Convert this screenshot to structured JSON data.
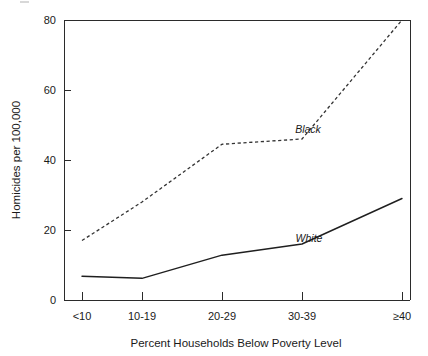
{
  "chart_data": {
    "type": "line",
    "title": "",
    "subtitle": "",
    "xlabel": "Percent Households Below Poverty Level",
    "ylabel": "Homicides per 100,000",
    "categories": [
      "<10",
      "10-19",
      "20-29",
      "30-39",
      "≥40"
    ],
    "series": [
      {
        "name": "Black",
        "style": "dashed",
        "color": "#333333",
        "values": [
          17,
          28,
          44.5,
          46,
          80
        ],
        "label_position": "above-right-of-midline"
      },
      {
        "name": "White",
        "style": "solid",
        "color": "#1f1f1f",
        "values": [
          6.8,
          6.2,
          12.8,
          16,
          29
        ],
        "label_position": "above-line-right"
      }
    ],
    "ylim": [
      0,
      80
    ],
    "yticks": [
      0,
      20,
      40,
      60,
      80
    ],
    "ytick_labels": [
      "0",
      "20",
      "40",
      "60",
      "80"
    ],
    "xticks": [
      "<10",
      "10-19",
      "20-29",
      "30-39",
      "≥40"
    ],
    "grid": false,
    "legend": "inline-annotations",
    "legend_position": "inline",
    "annotations": [
      {
        "text": "Black",
        "series": "Black"
      },
      {
        "text": "White",
        "series": "White"
      }
    ]
  },
  "axes": {
    "y_title": "Homicides per 100,000",
    "x_title": "Percent Households Below Poverty Level",
    "y_tick_labels": [
      "80",
      "60",
      "40",
      "20",
      "0"
    ],
    "x_tick_labels": [
      "<10",
      "10-19",
      "20-29",
      "30-39",
      "≥40"
    ]
  },
  "series_labels": {
    "black": "Black",
    "white": "White"
  },
  "colors": {
    "axis": "#2b2b2b",
    "black_series": "#333333",
    "white_series": "#1f1f1f",
    "background": "#ffffff",
    "text": "#1a1a1a"
  }
}
